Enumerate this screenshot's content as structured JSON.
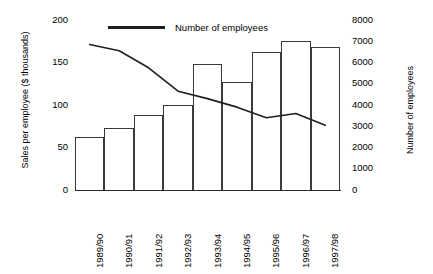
{
  "chart_data": {
    "type": "bar",
    "title": "",
    "xlabel": "",
    "ylabel": "Sales per employee ($ thousands)",
    "y2label": "Number of employees",
    "categories": [
      "1989/90",
      "1990/91",
      "1991/92",
      "1992/93",
      "1993/94",
      "1994/95",
      "1995/96",
      "1996/97",
      "1997/98"
    ],
    "series": [
      {
        "name": "Sales per employee ($ thousands)",
        "type": "bar",
        "axis": "left",
        "values": [
          62,
          73,
          88,
          100,
          148,
          127,
          162,
          175,
          168
        ]
      },
      {
        "name": "Number of employees",
        "type": "line",
        "axis": "right",
        "values": [
          6850,
          6550,
          5750,
          4650,
          4300,
          3900,
          3400,
          3600,
          3050
        ]
      }
    ],
    "ylim": [
      0,
      200
    ],
    "y2lim": [
      0,
      8000
    ],
    "yticks": [
      0,
      50,
      100,
      150,
      200
    ],
    "y2ticks": [
      0,
      1000,
      2000,
      3000,
      4000,
      5000,
      6000,
      7000,
      8000
    ],
    "grid": false,
    "legend": {
      "position": "top-left",
      "entries": [
        "Number of employees"
      ]
    }
  },
  "axes": {
    "left_title": "Sales per employee ($ thousands)",
    "right_title": "Number of employees",
    "left_ticks": [
      "200",
      "150",
      "100",
      "50",
      "0"
    ],
    "right_ticks": [
      "8000",
      "7000",
      "6000",
      "5000",
      "4000",
      "3000",
      "2000",
      "1000",
      "0"
    ]
  },
  "legend": {
    "series_label": "Number of employees"
  },
  "colors": {
    "bar_stroke": "#3a3a3a",
    "line": "#1f1f1f",
    "axis": "#2b2b2b",
    "text": "#000000",
    "background": "#ffffff"
  }
}
